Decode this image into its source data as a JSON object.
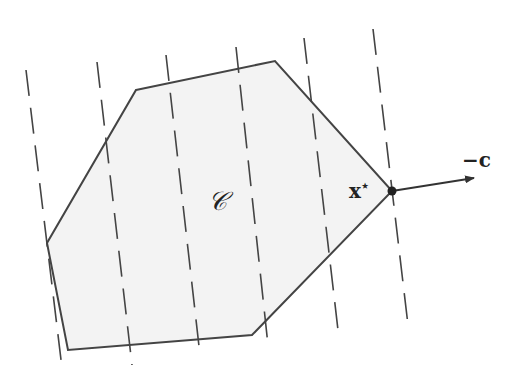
{
  "diagram": {
    "region_label": "𝒞",
    "point_label": "x*",
    "direction_label": "−c",
    "colors": {
      "stroke": "#444444",
      "fill": "#f3f3f3",
      "background": "#ffffff"
    },
    "polygon_vertices": [
      [
        136,
        90
      ],
      [
        275,
        61
      ],
      [
        392,
        191
      ],
      [
        252,
        335
      ],
      [
        68,
        350
      ],
      [
        47,
        243
      ]
    ],
    "level_lines": [
      {
        "x1": 26,
        "y1": 70,
        "x2": 62,
        "y2": 368
      },
      {
        "x1": 97,
        "y1": 62,
        "x2": 132,
        "y2": 365
      },
      {
        "x1": 166,
        "y1": 55,
        "x2": 200,
        "y2": 355
      },
      {
        "x1": 236,
        "y1": 47,
        "x2": 268,
        "y2": 345
      },
      {
        "x1": 304,
        "y1": 38,
        "x2": 338,
        "y2": 330
      },
      {
        "x1": 373,
        "y1": 29,
        "x2": 408,
        "y2": 325
      }
    ],
    "optimum_point": [
      392,
      191
    ],
    "arrow_end": [
      474,
      178
    ]
  }
}
